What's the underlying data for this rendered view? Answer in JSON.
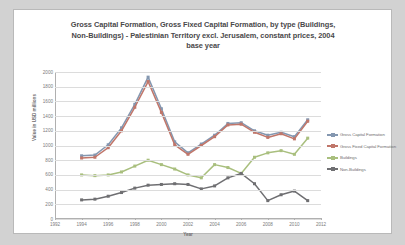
{
  "chart_data": {
    "type": "line",
    "title": "Gross Capital Formation, Gross Fixed Capital Formation, by type (Buildings, Non-Buildings) - Palestinian Territory excl. Jerusalem, constant prices, 2004 base year",
    "title_lines": [
      "Gross Capital Formation, Gross Fixed Capital Formation, by type (Buildings,",
      "Non-Buildings) - Palestinian Territory excl. Jerusalem, constant prices, 2004",
      "base year"
    ],
    "xlabel": "Year",
    "ylabel": "Value in USD millions",
    "xlim": [
      1992,
      2012
    ],
    "ylim": [
      0,
      2000
    ],
    "ytick_step": 200,
    "xtick_step": 2,
    "grid": true,
    "legend_position": "right",
    "ytick_labels": [
      "0",
      "200",
      "400",
      "600",
      "800",
      "1000",
      "1200",
      "1400",
      "1600",
      "1800",
      "2000"
    ],
    "xtick_labels": [
      "1992",
      "1994",
      "1996",
      "1998",
      "2000",
      "2002",
      "2004",
      "2006",
      "2008",
      "2010",
      "2012"
    ],
    "x": [
      1994,
      1995,
      1996,
      1997,
      1998,
      1999,
      2000,
      2001,
      2002,
      2003,
      2004,
      2005,
      2006,
      2007,
      2008,
      2009,
      2010,
      2011
    ],
    "series": [
      {
        "name": "Gross Capital Formation",
        "color": "#8497b0",
        "values": [
          860,
          870,
          1010,
          1240,
          1560,
          1930,
          1500,
          1050,
          900,
          1020,
          1140,
          1300,
          1310,
          1200,
          1140,
          1180,
          1120,
          1350
        ]
      },
      {
        "name": "Gross Fixed Capital Formation",
        "color": "#c0766a",
        "values": [
          830,
          840,
          970,
          1200,
          1520,
          1870,
          1450,
          1010,
          880,
          1000,
          1120,
          1280,
          1290,
          1180,
          1110,
          1160,
          1090,
          1330
        ]
      },
      {
        "name": "Buildings",
        "color": "#a9bf7e",
        "values": [
          600,
          590,
          600,
          640,
          720,
          800,
          740,
          680,
          600,
          560,
          740,
          700,
          620,
          840,
          900,
          930,
          880,
          1100
        ]
      },
      {
        "name": "Non-Buildings",
        "color": "#6f6f72",
        "values": [
          260,
          270,
          310,
          360,
          420,
          460,
          470,
          480,
          470,
          410,
          450,
          560,
          620,
          480,
          250,
          330,
          380,
          250
        ]
      }
    ]
  },
  "legend": {
    "items": [
      {
        "label": "Gross Capital Formation"
      },
      {
        "label": "Gross Fixed Capital Formation"
      },
      {
        "label": "Buildings"
      },
      {
        "label": "Non-Buildings"
      }
    ]
  }
}
